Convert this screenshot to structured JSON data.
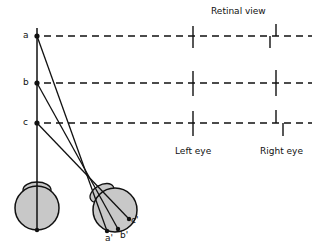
{
  "title": "Retinal view",
  "points": [
    {
      "name": "a",
      "y": 36
    },
    {
      "name": "b",
      "y": 83
    },
    {
      "name": "c",
      "y": 123
    }
  ],
  "retinal_points": [
    {
      "name": "a'",
      "x": 104,
      "y": 232
    },
    {
      "name": "b'",
      "x": 116,
      "y": 230
    },
    {
      "name": "c'",
      "x": 128,
      "y": 220
    }
  ],
  "eye_labels": {
    "left": "Left eye",
    "right": "Right eye"
  },
  "colors": {
    "line": "#111111",
    "eye_fill": "#c8c8c8"
  }
}
